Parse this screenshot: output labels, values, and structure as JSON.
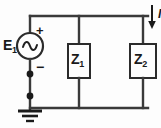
{
  "diagram": {
    "background_color": "#fdfdfd",
    "wire_color": "#3a3a3a",
    "ink_color": "#1a1a1a"
  },
  "source": {
    "label": "E",
    "subscript": "1",
    "plus_label": "+",
    "minus_label": "−",
    "symbol": "ac-source-sine",
    "type": "AC voltage source"
  },
  "components": [
    {
      "label": "Z",
      "subscript": "1",
      "symbol": "impedance-box",
      "name": "Z1"
    },
    {
      "label": "Z",
      "subscript": "2",
      "symbol": "impedance-box",
      "name": "Z2"
    }
  ],
  "current": {
    "label": "I",
    "direction": "down",
    "symbol": "arrow-down-icon"
  },
  "ground": {
    "symbol": "earth-ground-icon",
    "label": ""
  },
  "nodes": {
    "junction_upper": "junction-dot",
    "junction_lower": "junction-dot"
  }
}
